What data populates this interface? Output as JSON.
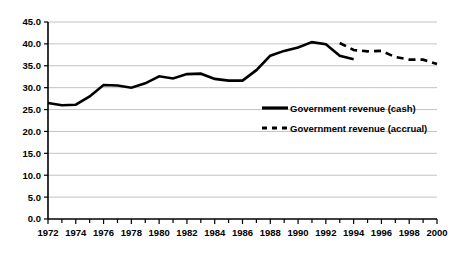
{
  "chart_data": {
    "type": "line",
    "title": "",
    "subtitle": "",
    "xlabel": "",
    "ylabel": "",
    "xlim": [
      1972,
      2000
    ],
    "ylim": [
      0.0,
      45.0
    ],
    "grid": true,
    "legend_position": "center-right-inside",
    "y_ticks": [
      "45.0",
      "40.0",
      "35.0",
      "30.0",
      "25.0",
      "20.0",
      "15.0",
      "10.0",
      "5.0",
      "0.0"
    ],
    "y_tick_values": [
      45.0,
      40.0,
      35.0,
      30.0,
      25.0,
      20.0,
      15.0,
      10.0,
      5.0,
      0.0
    ],
    "x_ticks": [
      "1972",
      "1974",
      "1976",
      "1978",
      "1980",
      "1982",
      "1984",
      "1986",
      "1988",
      "1990",
      "1992",
      "1994",
      "1996",
      "1998",
      "2000"
    ],
    "x_tick_values": [
      1972,
      1974,
      1976,
      1978,
      1980,
      1982,
      1984,
      1986,
      1988,
      1990,
      1992,
      1994,
      1996,
      1998,
      2000
    ],
    "x_minor_tick_values": [
      1973,
      1975,
      1977,
      1979,
      1981,
      1983,
      1985,
      1987,
      1989,
      1991,
      1993,
      1995,
      1997,
      1999
    ],
    "series": [
      {
        "name": "Government revenue (cash)",
        "style": "solid",
        "color": "#000000",
        "x": [
          1972,
          1973,
          1974,
          1975,
          1976,
          1977,
          1978,
          1979,
          1980,
          1981,
          1982,
          1983,
          1984,
          1985,
          1986,
          1987,
          1988,
          1989,
          1990,
          1991,
          1992,
          1993,
          1994
        ],
        "values": [
          26.5,
          26.0,
          26.1,
          28.0,
          30.6,
          30.5,
          30.0,
          31.0,
          32.6,
          32.1,
          33.1,
          33.2,
          32.0,
          31.6,
          31.6,
          34.0,
          37.3,
          38.4,
          39.2,
          40.4,
          39.9,
          37.3,
          36.5
        ]
      },
      {
        "name": "Government revenue (accrual)",
        "style": "dashed",
        "color": "#000000",
        "x": [
          1993,
          1994,
          1995,
          1996,
          1997,
          1998,
          1999,
          2000
        ],
        "values": [
          40.2,
          38.6,
          38.3,
          38.4,
          37.0,
          36.4,
          36.4,
          35.4
        ]
      }
    ]
  },
  "legend": {
    "items": [
      {
        "label": "Government revenue (cash)",
        "style": "solid"
      },
      {
        "label": "Government revenue (accrual)",
        "style": "dashed"
      }
    ]
  }
}
